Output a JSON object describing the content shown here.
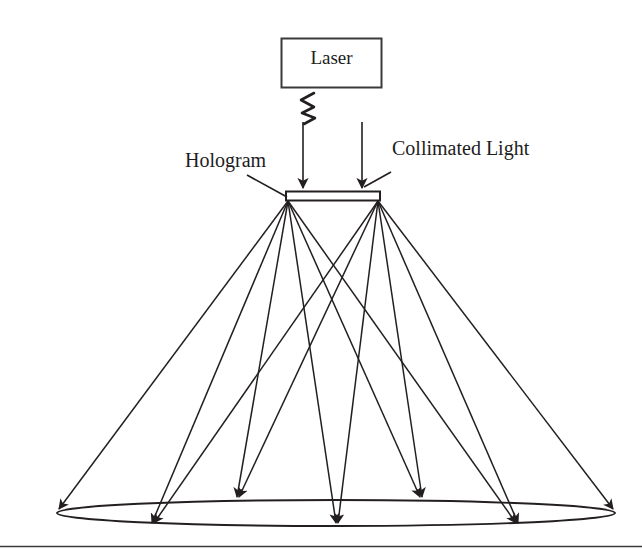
{
  "figure": {
    "type": "optical-ray-diagram",
    "width": 642,
    "height": 549,
    "background_color": "#ffffff",
    "stroke_color": "#231f20",
    "text_color": "#1d1d1d"
  },
  "labels": {
    "laser": "Laser",
    "hologram": "Hologram",
    "collimated_light": "Collimated Light"
  },
  "components": {
    "laser_box": {
      "name": "Laser",
      "x": 281,
      "y": 38,
      "width": 101,
      "height": 50,
      "stroke_color": "#3a3a3a"
    },
    "beam_squiggle": {
      "name": "laser-beam-squiggle",
      "points": "313,94 302,100 314,106 303,112 315,117 305,122",
      "stroke_color": "#231f20"
    },
    "hologram_plate": {
      "name": "hologram-plate",
      "x": 286,
      "y": 191,
      "width": 94,
      "height": 10,
      "stroke_color": "#231f20"
    },
    "collimated_beams": [
      {
        "name": "collimated-beam-left",
        "x": 303,
        "y_start": 120,
        "y_end": 189
      },
      {
        "name": "collimated-beam-right",
        "x": 362,
        "y_start": 120,
        "y_end": 189
      }
    ],
    "leader_lines": [
      {
        "name": "leader-hologram",
        "x1": 248,
        "y1": 176,
        "x2": 287,
        "y2": 197
      },
      {
        "name": "leader-collimated",
        "x1": 390,
        "y1": 171,
        "x2": 364,
        "y2": 186
      }
    ],
    "ellipse": {
      "name": "image-plane-ellipse",
      "cx": 336,
      "cy": 513,
      "rx": 279,
      "ry": 13,
      "stroke_color": "#231f20"
    },
    "ray_sources": [
      {
        "name": "hologram-point-left",
        "x": 288,
        "y": 200
      },
      {
        "name": "hologram-point-right",
        "x": 378,
        "y": 200
      }
    ],
    "ray_targets": [
      {
        "name": "focus-far-left",
        "x": 59,
        "y": 512
      },
      {
        "name": "focus-left",
        "x": 153,
        "y": 526
      },
      {
        "name": "focus-mid-left",
        "x": 238,
        "y": 500
      },
      {
        "name": "focus-center",
        "x": 337,
        "y": 526
      },
      {
        "name": "focus-mid-right",
        "x": 421,
        "y": 500
      },
      {
        "name": "focus-right",
        "x": 517,
        "y": 526
      },
      {
        "name": "focus-far-right",
        "x": 613,
        "y": 512
      }
    ],
    "rays_from_left_source": [
      {
        "name": "ray-L1",
        "to": "focus-far-left"
      },
      {
        "name": "ray-L2",
        "to": "focus-left"
      },
      {
        "name": "ray-L3",
        "to": "focus-mid-left"
      },
      {
        "name": "ray-L4",
        "to": "focus-center"
      },
      {
        "name": "ray-L5",
        "to": "focus-mid-right"
      },
      {
        "name": "ray-L6",
        "to": "focus-right"
      }
    ],
    "rays_from_right_source": [
      {
        "name": "ray-R1",
        "to": "focus-left"
      },
      {
        "name": "ray-R2",
        "to": "focus-mid-left"
      },
      {
        "name": "ray-R3",
        "to": "focus-center"
      },
      {
        "name": "ray-R4",
        "to": "focus-mid-right"
      },
      {
        "name": "ray-R5",
        "to": "focus-right"
      },
      {
        "name": "ray-R6",
        "to": "focus-far-right"
      }
    ],
    "footer_rule": {
      "name": "page-footer-rule",
      "y": 546
    }
  }
}
